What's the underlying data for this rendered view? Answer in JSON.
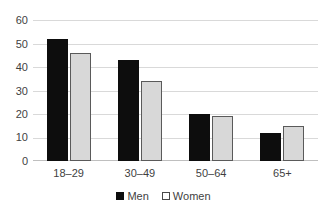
{
  "chart_data": {
    "type": "bar",
    "title": "",
    "subtitle": "",
    "xlabel": "",
    "ylabel": "",
    "categories": [
      "18–29",
      "30–49",
      "50–64",
      "65+"
    ],
    "series": [
      {
        "name": "Men",
        "values": [
          52,
          43,
          20,
          12
        ],
        "color": "#0d0d0d"
      },
      {
        "name": "Women",
        "values": [
          46,
          34,
          19,
          15
        ],
        "color": "#d8d8d8"
      }
    ],
    "ylim": [
      0,
      60
    ],
    "ytick_values": [
      0,
      10,
      20,
      30,
      40,
      50,
      60
    ],
    "ytick_labels": [
      "0",
      "10",
      "20",
      "30",
      "40",
      "50",
      "60"
    ],
    "grid": true,
    "grid_axis": "y",
    "grid_color": "#d9d9d9",
    "legend_position": "bottom",
    "legend": [
      "Men",
      "Women"
    ],
    "annotations": []
  },
  "legend": {
    "men_label": "Men",
    "women_label": "Women"
  },
  "colors": {
    "men_fill": "#0d0d0d",
    "women_fill": "#d8d8d8",
    "women_border": "#5a5a5a",
    "gridline": "#d9d9d9",
    "text": "#3f3f3f",
    "background": "#ffffff"
  }
}
